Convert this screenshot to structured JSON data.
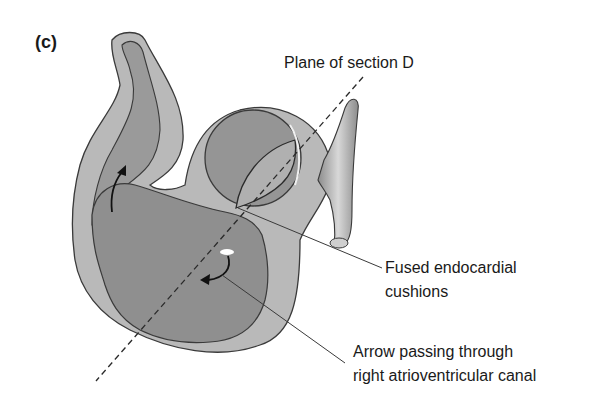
{
  "figure": {
    "panel_label": "(c)",
    "labels": {
      "plane": "Plane of section D",
      "cushions_line1": "Fused endocardial",
      "cushions_line2": "cushions",
      "arrow_line1": "Arrow passing through",
      "arrow_line2": "right atrioventricular canal"
    },
    "colors": {
      "outer_wall": "#b9b9b9",
      "inner_lumen": "#8f8f8f",
      "outline": "#3a3a3a",
      "vessel": "#a8a8a8",
      "text": "#1a1a1a"
    }
  }
}
